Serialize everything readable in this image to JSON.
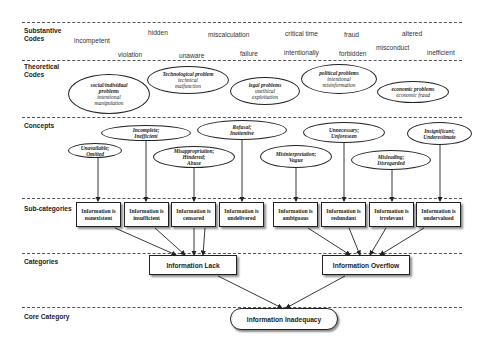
{
  "rows": {
    "substantive": "Substantive\nCodes",
    "theoretical": "Theoretical\nCodes",
    "concepts": "Concepts",
    "subcategories": "Sub-categories",
    "categories": "Categories",
    "core": "Core Category"
  },
  "substantive_codes": [
    {
      "text": "incompetent"
    },
    {
      "text": "violation"
    },
    {
      "text": "hidden"
    },
    {
      "text": "unaware"
    },
    {
      "text": "miscalculation"
    },
    {
      "text": "failure"
    },
    {
      "text": "critical time"
    },
    {
      "text": "intentionally"
    },
    {
      "text": "fraud"
    },
    {
      "text": "forbidden"
    },
    {
      "text": "misconduct"
    },
    {
      "text": "altered"
    },
    {
      "text": "inefficient"
    }
  ],
  "theoretical_codes": [
    {
      "title": "social/individual problems",
      "detail": "intentional manipulation"
    },
    {
      "title": "Technological problem",
      "detail": "technical malfunction"
    },
    {
      "title": "legal problems",
      "detail": "unethical exploitation"
    },
    {
      "title": "political problems",
      "detail": "intentional misinformation"
    },
    {
      "title": "economic problems",
      "detail": "economic fraud"
    }
  ],
  "concepts": [
    {
      "line1": "Unavailable;",
      "line2": "Omitted",
      "line3": ""
    },
    {
      "line1": "Incomplete;",
      "line2": "Inefficient",
      "line3": ""
    },
    {
      "line1": "Misappropriation;",
      "line2": "Hindered;",
      "line3": "Abuse"
    },
    {
      "line1": "Refusal;",
      "line2": "Inattentive",
      "line3": ""
    },
    {
      "line1": "Misinterpretation;",
      "line2": "Vague",
      "line3": ""
    },
    {
      "line1": "Unnecessary;",
      "line2": "Unforeseen",
      "line3": ""
    },
    {
      "line1": "Misleading;",
      "line2": "Disregarded",
      "line3": ""
    },
    {
      "line1": "Insignificant;",
      "line2": "Underestimate",
      "line3": ""
    }
  ],
  "subcategories": [
    {
      "line1": "Information is",
      "line2": "nonexistent"
    },
    {
      "line1": "Information is",
      "line2": "insufficient"
    },
    {
      "line1": "Information is",
      "line2": "censored"
    },
    {
      "line1": "Information is",
      "line2": "undelivered"
    },
    {
      "line1": "Information is",
      "line2": "ambiguous"
    },
    {
      "line1": "Information is",
      "line2": "redundant"
    },
    {
      "line1": "Information is",
      "line2": "irrelevant"
    },
    {
      "line1": "Information is",
      "line2": "undervalued"
    }
  ],
  "categories": [
    {
      "label": "Information Lack"
    },
    {
      "label": "Information Overflow"
    }
  ],
  "core_category": {
    "label": "Information Inadequacy"
  }
}
